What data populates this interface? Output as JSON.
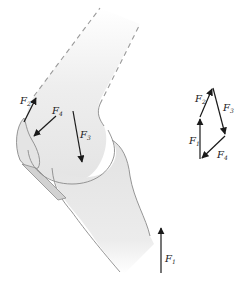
{
  "colors": {
    "bone_fill": "#e6e6e6",
    "bone_stroke": "#8a8a8a",
    "arrow": "#1a1a1a",
    "dashed": "#9a9a9a",
    "background": "#ffffff"
  },
  "knee": {
    "forces": {
      "F1": {
        "base": "F",
        "sub": "1"
      },
      "F2": {
        "base": "F",
        "sub": "2"
      },
      "F3": {
        "base": "F",
        "sub": "3"
      },
      "F4": {
        "base": "F",
        "sub": "4"
      }
    }
  },
  "polygon": {
    "forces": {
      "F1": {
        "base": "F",
        "sub": "1"
      },
      "F2": {
        "base": "F",
        "sub": "2"
      },
      "F3": {
        "base": "F",
        "sub": "3"
      },
      "F4": {
        "base": "F",
        "sub": "4"
      }
    }
  }
}
